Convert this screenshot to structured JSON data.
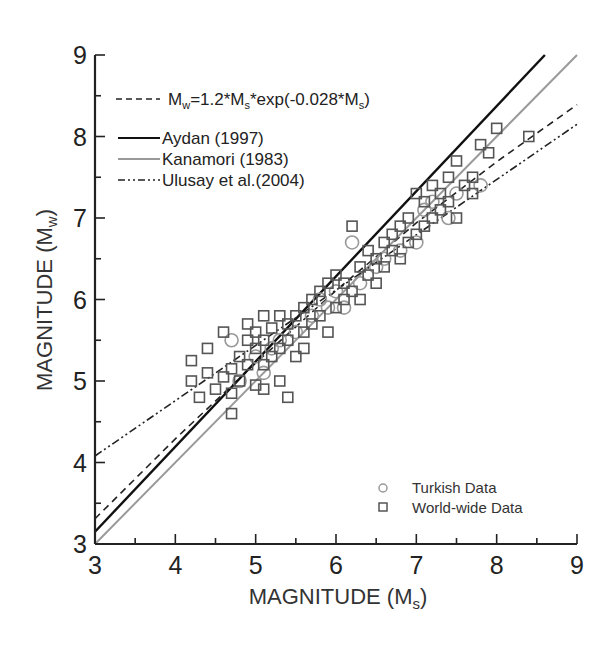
{
  "chart_data": {
    "type": "scatter",
    "title": "",
    "xlabel": "MAGNITUDE (Ms)",
    "xlabel_main": "MAGNITUDE (M",
    "xlabel_sub": "s",
    "ylabel": "MAGNITUDE (Mw)",
    "ylabel_main": "MAGNITUDE (M",
    "ylabel_sub": "w",
    "xlim": [
      3,
      9
    ],
    "ylim": [
      3,
      9
    ],
    "xticks": [
      "3",
      "4",
      "5",
      "6",
      "7",
      "8",
      "9"
    ],
    "yticks": [
      "3",
      "4",
      "5",
      "6",
      "7",
      "8",
      "9"
    ],
    "grid": false,
    "legend_top": {
      "position": "upper-left",
      "entries": [
        {
          "label": "Mw=1.2*Ms*exp(-0.028*Ms)",
          "style": "dashed",
          "color": "#222222"
        },
        {
          "label": "Aydan (1997)",
          "style": "solid",
          "color": "#111111"
        },
        {
          "label": "Kanamori (1983)",
          "style": "solid",
          "color": "#999999"
        },
        {
          "label": "Ulusay et al.(2004)",
          "style": "dash-dot-dot",
          "color": "#222222"
        }
      ]
    },
    "legend_bottom": {
      "position": "lower-right",
      "entries": [
        {
          "label": "Turkish Data",
          "marker": "circle",
          "color": "#999999"
        },
        {
          "label": "World-wide Data",
          "marker": "square",
          "color": "#555555"
        }
      ]
    },
    "lines": [
      {
        "name": "Mw=1.2*Ms*exp(-0.028*Ms)",
        "style": "dashed",
        "x": [
          3,
          4,
          5,
          6,
          7,
          8,
          9
        ],
        "y": [
          3.31,
          4.29,
          5.22,
          6.11,
          6.94,
          7.69,
          8.39
        ]
      },
      {
        "name": "Aydan (1997)",
        "style": "solid",
        "x": [
          3,
          8.6
        ],
        "y": [
          3.15,
          9.0
        ]
      },
      {
        "name": "Kanamori (1983)",
        "style": "solid-gray",
        "x": [
          3,
          9
        ],
        "y": [
          3.0,
          9.0
        ]
      },
      {
        "name": "Ulusay et al.(2004)",
        "style": "dash-dot-dot",
        "x": [
          3,
          9
        ],
        "y": [
          4.08,
          8.15
        ]
      }
    ],
    "series": [
      {
        "name": "Turkish Data",
        "marker": "circle",
        "points": [
          [
            4.7,
            5.5
          ],
          [
            4.8,
            5.0
          ],
          [
            5.0,
            5.3
          ],
          [
            5.1,
            5.1
          ],
          [
            5.2,
            5.4
          ],
          [
            5.3,
            5.5
          ],
          [
            5.5,
            5.6
          ],
          [
            5.7,
            5.8
          ],
          [
            5.8,
            6.0
          ],
          [
            5.9,
            5.9
          ],
          [
            6.0,
            6.1
          ],
          [
            6.1,
            5.9
          ],
          [
            6.2,
            6.7
          ],
          [
            6.3,
            6.2
          ],
          [
            6.5,
            6.4
          ],
          [
            6.6,
            6.5
          ],
          [
            6.8,
            6.6
          ],
          [
            7.0,
            6.7
          ],
          [
            7.1,
            7.1
          ],
          [
            7.2,
            7.2
          ],
          [
            7.4,
            7.0
          ],
          [
            7.5,
            7.3
          ],
          [
            7.8,
            7.4
          ]
        ]
      },
      {
        "name": "World-wide Data",
        "marker": "square",
        "points": [
          [
            4.2,
            5.0
          ],
          [
            4.2,
            5.25
          ],
          [
            4.3,
            4.8
          ],
          [
            4.4,
            5.1
          ],
          [
            4.4,
            5.4
          ],
          [
            4.5,
            4.9
          ],
          [
            4.6,
            5.05
          ],
          [
            4.6,
            5.6
          ],
          [
            4.7,
            4.6
          ],
          [
            4.7,
            4.85
          ],
          [
            4.7,
            5.15
          ],
          [
            4.8,
            5.0
          ],
          [
            4.8,
            5.3
          ],
          [
            4.9,
            5.2
          ],
          [
            4.9,
            5.5
          ],
          [
            4.9,
            5.7
          ],
          [
            5.0,
            4.95
          ],
          [
            5.0,
            5.4
          ],
          [
            5.0,
            5.6
          ],
          [
            5.1,
            4.9
          ],
          [
            5.1,
            5.2
          ],
          [
            5.1,
            5.5
          ],
          [
            5.1,
            5.8
          ],
          [
            5.2,
            5.3
          ],
          [
            5.2,
            5.65
          ],
          [
            5.3,
            5.0
          ],
          [
            5.3,
            5.4
          ],
          [
            5.3,
            5.8
          ],
          [
            5.4,
            4.8
          ],
          [
            5.4,
            5.5
          ],
          [
            5.4,
            5.7
          ],
          [
            5.5,
            5.3
          ],
          [
            5.5,
            5.8
          ],
          [
            5.6,
            5.6
          ],
          [
            5.6,
            5.9
          ],
          [
            5.6,
            5.4
          ],
          [
            5.7,
            5.7
          ],
          [
            5.7,
            6.0
          ],
          [
            5.8,
            5.8
          ],
          [
            5.8,
            6.1
          ],
          [
            5.9,
            5.6
          ],
          [
            5.9,
            6.2
          ],
          [
            6.0,
            5.9
          ],
          [
            6.0,
            6.3
          ],
          [
            6.1,
            6.0
          ],
          [
            6.1,
            6.2
          ],
          [
            6.2,
            6.9
          ],
          [
            6.2,
            6.1
          ],
          [
            6.3,
            6.4
          ],
          [
            6.3,
            6.0
          ],
          [
            6.4,
            6.3
          ],
          [
            6.4,
            6.6
          ],
          [
            6.5,
            6.2
          ],
          [
            6.5,
            6.5
          ],
          [
            6.6,
            6.7
          ],
          [
            6.6,
            6.4
          ],
          [
            6.7,
            6.6
          ],
          [
            6.7,
            6.8
          ],
          [
            6.8,
            6.5
          ],
          [
            6.8,
            6.9
          ],
          [
            6.9,
            6.7
          ],
          [
            6.9,
            7.0
          ],
          [
            7.0,
            6.8
          ],
          [
            7.0,
            7.3
          ],
          [
            7.1,
            6.9
          ],
          [
            7.1,
            7.2
          ],
          [
            7.2,
            7.0
          ],
          [
            7.2,
            7.4
          ],
          [
            7.3,
            7.1
          ],
          [
            7.3,
            7.3
          ],
          [
            7.4,
            7.5
          ],
          [
            7.4,
            7.2
          ],
          [
            7.5,
            7.0
          ],
          [
            7.5,
            7.7
          ],
          [
            7.6,
            7.4
          ],
          [
            7.7,
            7.3
          ],
          [
            7.7,
            7.5
          ],
          [
            7.8,
            7.9
          ],
          [
            7.9,
            7.8
          ],
          [
            8.0,
            8.1
          ],
          [
            8.4,
            8.0
          ]
        ]
      }
    ]
  }
}
